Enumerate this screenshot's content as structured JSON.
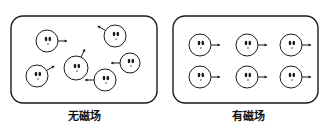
{
  "panels": [
    {
      "id": "no-field",
      "label": "无磁场",
      "box": {
        "x": 11,
        "y": 16,
        "w": 146,
        "h": 87,
        "r": 12
      },
      "particles": [
        {
          "cx": 47,
          "cy": 41,
          "r": 11,
          "arrow_angle": 0
        },
        {
          "cx": 76,
          "cy": 68,
          "r": 12,
          "arrow_angle": -65
        },
        {
          "cx": 115,
          "cy": 36,
          "r": 11,
          "arrow_angle": 210
        },
        {
          "cx": 130,
          "cy": 63,
          "r": 10,
          "arrow_angle": 180
        },
        {
          "cx": 37,
          "cy": 76,
          "r": 11,
          "arrow_angle": -30
        },
        {
          "cx": 105,
          "cy": 80,
          "r": 11,
          "arrow_angle": 180
        }
      ]
    },
    {
      "id": "with-field",
      "label": "有磁场",
      "box": {
        "x": 173,
        "y": 16,
        "w": 145,
        "h": 87,
        "r": 12
      },
      "particles": [
        {
          "cx": 200,
          "cy": 45,
          "r": 11,
          "arrow_angle": 0
        },
        {
          "cx": 247,
          "cy": 45,
          "r": 11,
          "arrow_angle": 0
        },
        {
          "cx": 291,
          "cy": 45,
          "r": 11,
          "arrow_angle": 0
        },
        {
          "cx": 200,
          "cy": 77,
          "r": 11,
          "arrow_angle": 0
        },
        {
          "cx": 247,
          "cy": 77,
          "r": 11,
          "arrow_angle": 0
        },
        {
          "cx": 291,
          "cy": 77,
          "r": 11,
          "arrow_angle": 0
        }
      ]
    }
  ],
  "colors": {
    "stroke": "#1a1a1a",
    "background": "#ffffff"
  }
}
